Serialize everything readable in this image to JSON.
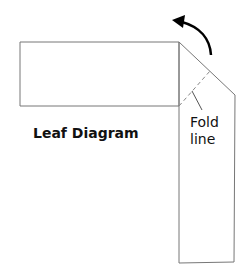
{
  "title": "Leaf Diagram",
  "annotation": {
    "line1": "Fold",
    "line2": "line"
  },
  "colors": {
    "stroke": "#777777",
    "arrow": "#000000",
    "text": "#111111"
  }
}
